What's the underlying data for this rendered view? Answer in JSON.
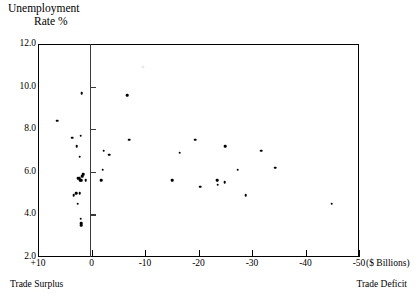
{
  "chart_data": {
    "type": "scatter",
    "title": "Unemployment Rate %",
    "title_lines": [
      "Unemployment",
      "Rate %"
    ],
    "xlabel": "($ Billions)",
    "ylabel": "Unemployment Rate %",
    "xlim": [
      10,
      -50
    ],
    "ylim": [
      2.0,
      12.0
    ],
    "grid": false,
    "legend": null,
    "x_ticks": [
      {
        "value": 10,
        "label": "+10"
      },
      {
        "value": 0,
        "label": "0"
      },
      {
        "value": -10,
        "label": "-10"
      },
      {
        "value": -20,
        "label": "-20"
      },
      {
        "value": -30,
        "label": "-30"
      },
      {
        "value": -40,
        "label": "-40"
      },
      {
        "value": -50,
        "label": "-50"
      }
    ],
    "y_ticks": [
      {
        "value": 12.0,
        "label": "12.0"
      },
      {
        "value": 10.0,
        "label": "10.0"
      },
      {
        "value": 8.0,
        "label": "8.0"
      },
      {
        "value": 6.0,
        "label": "6.0"
      },
      {
        "value": 4.0,
        "label": "4.0"
      },
      {
        "value": 2.0,
        "label": "2.0"
      }
    ],
    "annotations": [
      {
        "name": "trade-surplus-note",
        "text": "Trade Surplus",
        "position": "bottom-left"
      },
      {
        "name": "trade-deficit-note",
        "text": "Trade Deficit",
        "position": "bottom-right"
      }
    ],
    "x_unit_label": "($ Billions)",
    "zero_axis_value": 0,
    "point_color": "#000000",
    "axis_color": "#000000",
    "background_color": "#ffffff",
    "points": [
      {
        "x": 6.4,
        "y": 8.4
      },
      {
        "x": 1.8,
        "y": 9.7
      },
      {
        "x": 3.6,
        "y": 7.6
      },
      {
        "x": 2.0,
        "y": 7.7
      },
      {
        "x": 2.8,
        "y": 7.2
      },
      {
        "x": 2.2,
        "y": 6.7
      },
      {
        "x": 1.6,
        "y": 5.9
      },
      {
        "x": 1.7,
        "y": 5.8
      },
      {
        "x": 2.3,
        "y": 5.7
      },
      {
        "x": 2.6,
        "y": 5.7
      },
      {
        "x": 2.1,
        "y": 5.6
      },
      {
        "x": 1.9,
        "y": 5.6
      },
      {
        "x": 1.1,
        "y": 5.6
      },
      {
        "x": 2.9,
        "y": 5.0
      },
      {
        "x": 2.2,
        "y": 5.0
      },
      {
        "x": 3.3,
        "y": 4.9
      },
      {
        "x": 2.6,
        "y": 4.5
      },
      {
        "x": 2.0,
        "y": 3.8
      },
      {
        "x": 1.9,
        "y": 3.6
      },
      {
        "x": 1.9,
        "y": 3.5
      },
      {
        "x": -2.3,
        "y": 7.0
      },
      {
        "x": -3.3,
        "y": 6.8
      },
      {
        "x": -2.1,
        "y": 6.1
      },
      {
        "x": -1.8,
        "y": 5.6
      },
      {
        "x": -6.7,
        "y": 9.6
      },
      {
        "x": -7.0,
        "y": 7.5
      },
      {
        "x": -15.1,
        "y": 5.6
      },
      {
        "x": -16.5,
        "y": 6.9
      },
      {
        "x": -19.4,
        "y": 7.5
      },
      {
        "x": -20.3,
        "y": 5.3
      },
      {
        "x": -23.5,
        "y": 5.6
      },
      {
        "x": -23.6,
        "y": 5.4
      },
      {
        "x": -25.0,
        "y": 7.2
      },
      {
        "x": -24.9,
        "y": 5.5
      },
      {
        "x": -27.3,
        "y": 6.1
      },
      {
        "x": -28.8,
        "y": 4.9
      },
      {
        "x": -31.7,
        "y": 7.0
      },
      {
        "x": -34.3,
        "y": 6.2
      },
      {
        "x": -44.9,
        "y": 4.5
      }
    ],
    "faint_artifact": {
      "x": -9.6,
      "y": 10.9
    }
  }
}
